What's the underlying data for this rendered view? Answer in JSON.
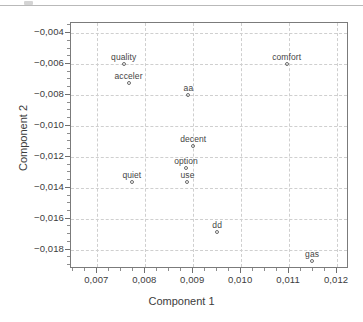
{
  "figure": {
    "axis_title_x": "Component 1",
    "axis_title_y": "Component 2",
    "frame_color": "#7b7b7b",
    "grid_color": "#cfcfcf",
    "marker_color": "#6b6b6b",
    "label_color": "#454545",
    "background": "#ffffff"
  },
  "artifacts": {
    "scan_rule_visible": true
  },
  "chart_data": {
    "type": "scatter",
    "title": "",
    "xlabel": "Component 1",
    "ylabel": "Component 2",
    "xlim": [
      0.00645,
      0.01225
    ],
    "ylim": [
      -0.01925,
      -0.00335
    ],
    "xticks": [
      0.007,
      0.008,
      0.009,
      0.01,
      0.011,
      0.012
    ],
    "yticks": [
      -0.004,
      -0.006,
      -0.008,
      -0.01,
      -0.012,
      -0.014,
      -0.016,
      -0.018
    ],
    "xticklabels": [
      "0,007",
      "0,008",
      "0,009",
      "0,010",
      "0,011",
      "0,012"
    ],
    "yticklabels": [
      "-0,004",
      "-0,006",
      "-0,008",
      "-0,010",
      "-0,012",
      "-0,014",
      "-0,016",
      "-0,018"
    ],
    "decimal_separator": ",",
    "grid": true,
    "grid_style": "dashed",
    "legend": null,
    "minor_ticks": true,
    "marker": "open-circle",
    "labels_position": "above-marker",
    "points": [
      {
        "label": "quality",
        "x": 0.00755,
        "y": -0.006
      },
      {
        "label": "acceler",
        "x": 0.00765,
        "y": -0.0072
      },
      {
        "label": "comfort",
        "x": 0.01095,
        "y": -0.006
      },
      {
        "label": "aa",
        "x": 0.0089,
        "y": -0.008
      },
      {
        "label": "decent",
        "x": 0.009,
        "y": -0.01133
      },
      {
        "label": "option",
        "x": 0.00885,
        "y": -0.0127
      },
      {
        "label": "use",
        "x": 0.00888,
        "y": -0.01365
      },
      {
        "label": "quiet",
        "x": 0.00772,
        "y": -0.01363
      },
      {
        "label": "dd",
        "x": 0.0095,
        "y": -0.01688
      },
      {
        "label": "gas",
        "x": 0.01148,
        "y": -0.01873
      }
    ]
  }
}
